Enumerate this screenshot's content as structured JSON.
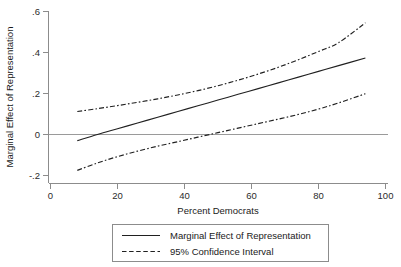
{
  "chart_data": {
    "type": "line",
    "title": "",
    "xlabel": "Percent Democrats",
    "ylabel": "Marginal Effect of Representation",
    "xlim": [
      0,
      100
    ],
    "ylim": [
      -0.2,
      0.6
    ],
    "xticks": [
      0,
      20,
      40,
      60,
      80,
      100
    ],
    "xticklabels": [
      "0",
      "20",
      "40",
      "60",
      "80",
      "100"
    ],
    "yticks": [
      -0.2,
      0,
      0.2,
      0.4,
      0.6
    ],
    "yticklabels": [
      "-.2",
      "0",
      ".2",
      ".4",
      ".6"
    ],
    "grid": false,
    "legend_position": "below-axes",
    "zero_reference_line": 0,
    "x": [
      8,
      14,
      20,
      26,
      32,
      38,
      44,
      50,
      56,
      62,
      68,
      74,
      80,
      86,
      94
    ],
    "series": [
      {
        "name": "Marginal Effect of Representation",
        "style": "solid",
        "values": [
          -0.03,
          0.0,
          0.028,
          0.056,
          0.084,
          0.112,
          0.14,
          0.168,
          0.196,
          0.224,
          0.252,
          0.28,
          0.308,
          0.336,
          0.373
        ]
      },
      {
        "name": "95% Confidence Interval Upper",
        "style": "dash-dot",
        "values": [
          0.112,
          0.126,
          0.141,
          0.157,
          0.174,
          0.193,
          0.214,
          0.238,
          0.265,
          0.295,
          0.328,
          0.365,
          0.405,
          0.448,
          0.545
        ]
      },
      {
        "name": "95% Confidence Interval Lower",
        "style": "dash-dot",
        "values": [
          -0.175,
          -0.139,
          -0.108,
          -0.081,
          -0.057,
          -0.035,
          -0.013,
          0.009,
          0.031,
          0.053,
          0.075,
          0.098,
          0.124,
          0.154,
          0.199
        ]
      }
    ],
    "annotations": []
  },
  "legend": {
    "entries": [
      {
        "label": "Marginal Effect of Representation",
        "style": "solid"
      },
      {
        "label": "95% Confidence Interval",
        "style": "dashed"
      }
    ]
  },
  "colors": {
    "line": "#202020",
    "axis": "#8c8c8c",
    "zero_line": "#9a9a9a",
    "background": "#ffffff",
    "text": "#1a1a1a"
  }
}
